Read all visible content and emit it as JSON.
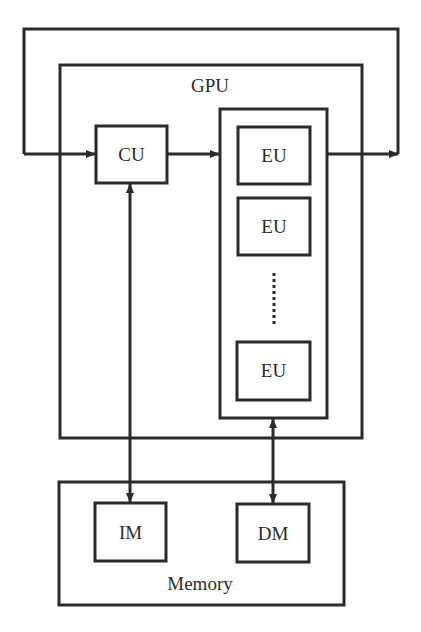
{
  "diagram": {
    "colors": {
      "stroke": "#2b2b2b",
      "background": "#ffffff"
    },
    "gpu": {
      "label": "GPU"
    },
    "cu": {
      "label": "CU"
    },
    "eu_units": [
      {
        "label": "EU"
      },
      {
        "label": "EU"
      },
      {
        "label": "EU"
      }
    ],
    "memory": {
      "label": "Memory"
    },
    "im": {
      "label": "IM"
    },
    "dm": {
      "label": "DM"
    },
    "edges": [
      {
        "from": "feedback-loop",
        "to": "CU",
        "type": "arrow"
      },
      {
        "from": "CU",
        "to": "EU-array",
        "type": "arrow"
      },
      {
        "from": "EU-array",
        "to": "feedback-loop",
        "type": "arrow"
      },
      {
        "from": "CU",
        "to": "IM",
        "type": "bidirectional"
      },
      {
        "from": "EU-array",
        "to": "DM",
        "type": "bidirectional"
      }
    ]
  }
}
